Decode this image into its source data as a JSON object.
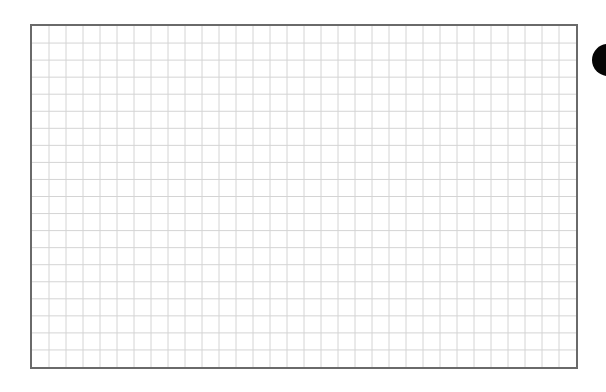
{
  "sheet": {
    "type": "graph-paper-grid",
    "columns": 32,
    "rows": 20,
    "grid_line_color": "#d4d4d4",
    "border_color": "#6a6a6a",
    "background_color": "#ffffff"
  },
  "marker": {
    "shape": "filled-circle",
    "color": "#050505"
  }
}
